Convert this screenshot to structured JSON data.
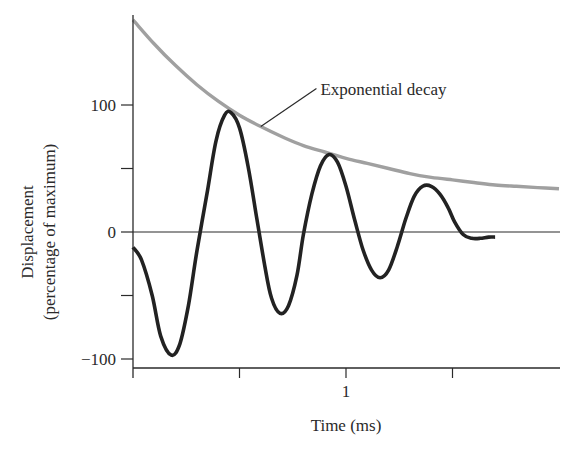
{
  "chart_data": {
    "type": "line",
    "title": "",
    "xlabel": "Time (ms)",
    "ylabel_line1": "Displacement",
    "ylabel_line2": "(percentage of maximum)",
    "xlim": [
      0,
      2.0
    ],
    "ylim": [
      -107,
      170
    ],
    "x_ticks": [
      0.5,
      1,
      1.5
    ],
    "x_tick_labels": [
      "",
      "1",
      ""
    ],
    "y_ticks": [
      -100,
      -50,
      0,
      50,
      100
    ],
    "y_tick_labels": [
      "−100",
      "",
      "0",
      "",
      "100"
    ],
    "grid": false,
    "zero_line": true,
    "annotation": {
      "text": "Exponential decay",
      "points_to": {
        "x": 0.6,
        "y": 83
      },
      "text_at": {
        "x": 0.88,
        "y": 113
      }
    },
    "series": [
      {
        "name": "Damped oscillation",
        "color": "#222222",
        "x": [
          0,
          0.04,
          0.09,
          0.13,
          0.18,
          0.22,
          0.26,
          0.3,
          0.35,
          0.39,
          0.43,
          0.46,
          0.5,
          0.54,
          0.58,
          0.62,
          0.65,
          0.69,
          0.73,
          0.77,
          0.8,
          0.84,
          0.88,
          0.92,
          0.96,
          1.0,
          1.04,
          1.08,
          1.12,
          1.16,
          1.2,
          1.24,
          1.28,
          1.32,
          1.36,
          1.4,
          1.44,
          1.48,
          1.51,
          1.55,
          1.59,
          1.63,
          1.67,
          1.7
        ],
        "y": [
          -12,
          -22,
          -50,
          -82,
          -97,
          -88,
          -58,
          -15,
          33,
          72,
          92,
          94,
          82,
          52,
          12,
          -28,
          -52,
          -64,
          -58,
          -34,
          -2,
          30,
          52,
          61,
          55,
          36,
          10,
          -14,
          -30,
          -36,
          -30,
          -12,
          10,
          28,
          36,
          36,
          30,
          19,
          8,
          -2,
          -5,
          -5,
          -4,
          -4
        ]
      },
      {
        "name": "Exponential decay",
        "color": "#a0a0a0",
        "x": [
          0,
          0.1,
          0.2,
          0.3,
          0.4,
          0.5,
          0.6,
          0.7,
          0.8,
          0.9,
          1.0,
          1.1,
          1.2,
          1.3,
          1.4,
          1.5,
          1.6,
          1.7,
          1.8,
          1.9,
          2.0
        ],
        "y": [
          167,
          148,
          131,
          116,
          103,
          92,
          83,
          75,
          68,
          63,
          58,
          54,
          50,
          46,
          43,
          41,
          39,
          37,
          36,
          35,
          34
        ]
      }
    ]
  }
}
